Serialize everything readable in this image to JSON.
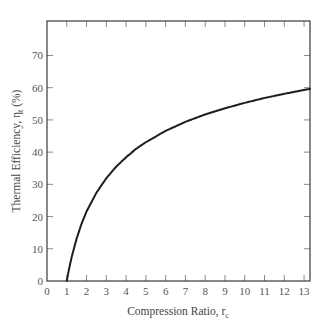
{
  "chart_data": {
    "type": "line",
    "title": "",
    "xlabel": "Compression Ratio, r_c",
    "xlabel_main": "Compression Ratio, r",
    "xlabel_sub": "c",
    "ylabel": "Thermal Efficiency, η_t (%)",
    "ylabel_main": "Thermal Efficiency, η",
    "ylabel_sub": "t",
    "ylabel_suffix": " (%)",
    "xlim": [
      0,
      13.3
    ],
    "ylim": [
      0,
      80.7
    ],
    "x_ticks": [
      0,
      1,
      2,
      3,
      4,
      5,
      6,
      7,
      8,
      9,
      10,
      11,
      12,
      13
    ],
    "y_ticks": [
      0,
      10,
      20,
      30,
      40,
      50,
      60,
      70
    ],
    "grid": false,
    "legend": null,
    "series": [
      {
        "name": "Thermal efficiency",
        "color": "#1e1e1e",
        "x": [
          1,
          1.1,
          1.25,
          1.5,
          1.75,
          2,
          2.5,
          3,
          3.5,
          4,
          4.5,
          5,
          6,
          7,
          8,
          9,
          10,
          11,
          12,
          13,
          13.3
        ],
        "values": [
          0,
          3.3,
          7.5,
          13.2,
          17.8,
          21.6,
          27.4,
          31.9,
          35.5,
          38.4,
          41.0,
          43.1,
          46.6,
          49.4,
          51.7,
          53.6,
          55.3,
          56.8,
          58.1,
          59.3,
          59.6
        ]
      }
    ]
  },
  "colors": {
    "axis": "#3a3a3a",
    "tick": "#8a8a8a",
    "tick_label": "#555555",
    "curve": "#1e1e1e",
    "background": "#ffffff"
  }
}
